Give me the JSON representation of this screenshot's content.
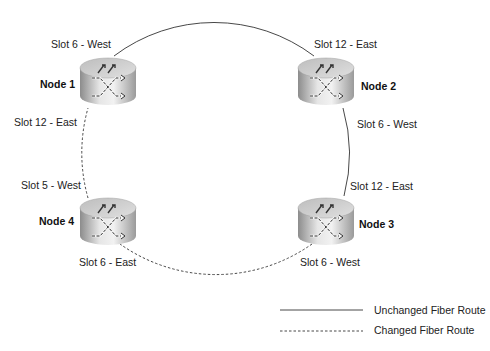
{
  "diagram": {
    "nodes": [
      {
        "id": "node-1",
        "label": "Node 1",
        "x": 108,
        "y": 82
      },
      {
        "id": "node-2",
        "label": "Node 2",
        "x": 326,
        "y": 82
      },
      {
        "id": "node-3",
        "label": "Node 3",
        "x": 326,
        "y": 222
      },
      {
        "id": "node-4",
        "label": "Node 4",
        "x": 108,
        "y": 222
      }
    ],
    "ports": {
      "node1_west": "Slot 6 - West",
      "node1_east": "Slot 12 - East",
      "node2_east": "Slot 12 - East",
      "node2_west": "Slot 6 - West",
      "node3_east": "Slot 12 - East",
      "node3_west": "Slot 6 - West",
      "node4_west": "Slot 5 - West",
      "node4_east": "Slot 6 - East"
    },
    "links": [
      {
        "from": "node-1",
        "to": "node-2",
        "style": "solid"
      },
      {
        "from": "node-2",
        "to": "node-3",
        "style": "solid"
      },
      {
        "from": "node-3",
        "to": "node-4",
        "style": "dashed"
      },
      {
        "from": "node-4",
        "to": "node-1",
        "style": "dashed"
      }
    ],
    "legend": {
      "solid": "Unchanged Fiber Route",
      "dashed": "Changed Fiber Route"
    },
    "colors": {
      "line": "#333333",
      "node_light": "#e8e8e8",
      "node_dark": "#8a8a8a"
    }
  }
}
